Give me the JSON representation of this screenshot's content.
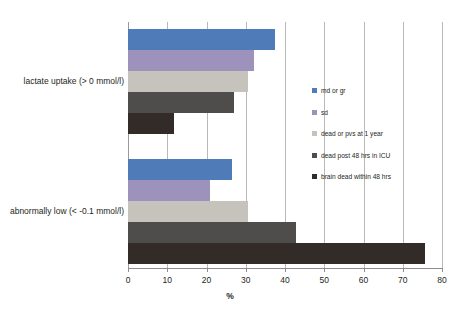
{
  "chart_data": {
    "type": "bar",
    "orientation": "horizontal",
    "title": "",
    "xlabel": "%",
    "ylabel": "",
    "xlim": [
      0,
      80
    ],
    "xticks": [
      0,
      10,
      20,
      30,
      40,
      50,
      60,
      70,
      80
    ],
    "grid": true,
    "legend_position": "inside-right",
    "categories": [
      "lactate uptake (> 0 mmol/l)",
      "abnormally low (< -0.1 mmol/l)"
    ],
    "series": [
      {
        "name": "md or gr",
        "color": "#4f7bb8",
        "values": [
          37.5,
          26.5
        ]
      },
      {
        "name": "sd",
        "color": "#9c92bc",
        "values": [
          32.0,
          21.0
        ]
      },
      {
        "name": "dead or pvs at 1 year",
        "color": "#c5c3bc",
        "values": [
          30.5,
          30.5
        ]
      },
      {
        "name": "dead post 48 hrs in ICU",
        "color": "#4f4d4b",
        "values": [
          27.0,
          42.8
        ]
      },
      {
        "name": "brain dead within 48 hrs",
        "color": "#332b28",
        "values": [
          11.7,
          75.7
        ]
      }
    ]
  },
  "axis": {
    "x_tick_labels": [
      "0",
      "10",
      "20",
      "30",
      "40",
      "50",
      "60",
      "70",
      "80"
    ],
    "x_title": "%"
  },
  "legend": {
    "items": [
      {
        "label": "md or gr",
        "color": "#4f7bb8"
      },
      {
        "label": "sd",
        "color": "#9c92bc"
      },
      {
        "label": "dead or pvs at 1 year",
        "color": "#c5c3bc"
      },
      {
        "label": "dead post 48 hrs in ICU",
        "color": "#4f4d4b"
      },
      {
        "label": "brain dead within 48 hrs",
        "color": "#332b28"
      }
    ]
  },
  "category_labels": [
    "lactate uptake (> 0 mmol/l)",
    "abnormally low (< -0.1 mmol/l)"
  ]
}
